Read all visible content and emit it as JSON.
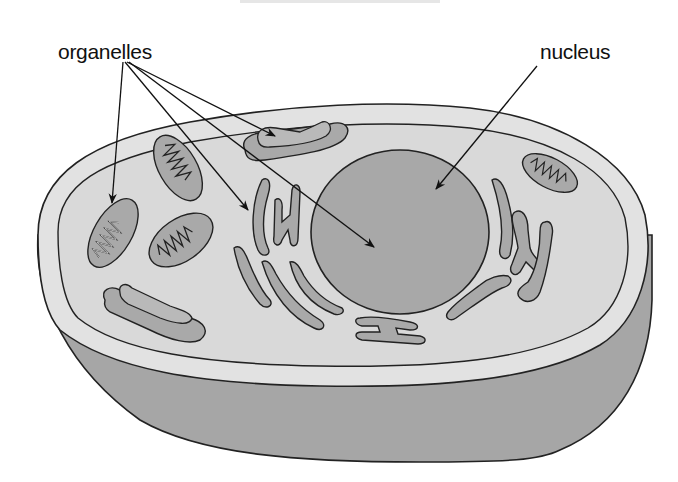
{
  "diagram": {
    "labels": {
      "organelles": "organelles",
      "nucleus": "nucleus"
    },
    "parts": [
      "cell-membrane",
      "cytoplasm",
      "nucleus",
      "mitochondrion",
      "golgi-apparatus",
      "endoplasmic-reticulum"
    ],
    "colors": {
      "outline": "#222222",
      "cytoplasm": "#d9d9d9",
      "membrane_band": "#e2e2e2",
      "side_wall": "#a6a6a6",
      "nucleus": "#a8a8a8",
      "organelle_fill": "#a9a9a9",
      "background": "#ffffff"
    }
  }
}
